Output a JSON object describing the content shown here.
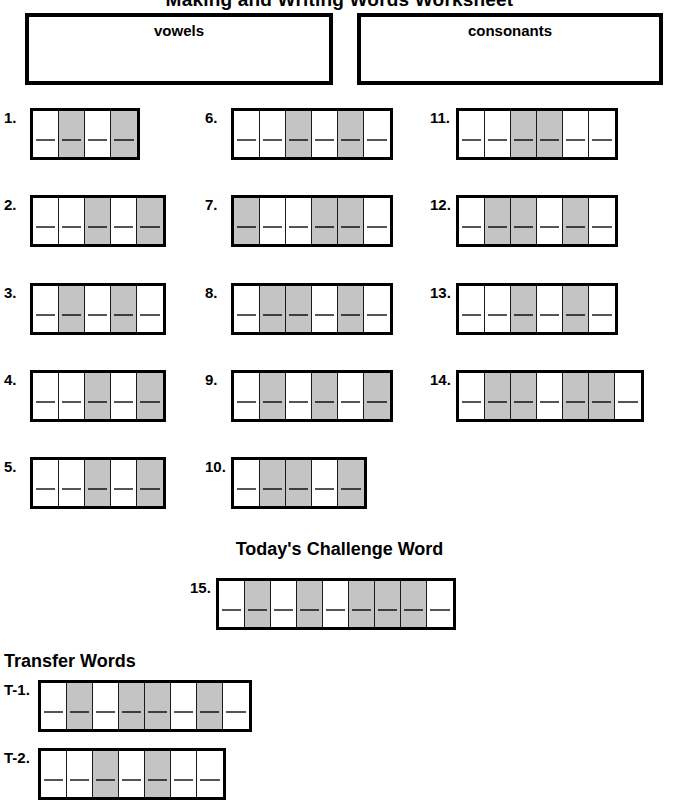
{
  "title": "Making and Writing Words Worksheet",
  "sort_boxes": [
    {
      "id": "vowels",
      "label": "vowels"
    },
    {
      "id": "consonants",
      "label": "consonants"
    }
  ],
  "headings": {
    "challenge": "Today's Challenge Word",
    "transfer": "Transfer Words"
  },
  "legend": {
    "shaded_color": "#c4c4c4",
    "unshaded_color": "#ffffff",
    "border_color": "#000000"
  },
  "word_rows": [
    {
      "number": "1.",
      "cells": 4,
      "shaded": [
        false,
        true,
        false,
        true
      ],
      "left": 4,
      "top": 108
    },
    {
      "number": "2.",
      "cells": 5,
      "shaded": [
        false,
        false,
        true,
        false,
        true
      ],
      "left": 4,
      "top": 195
    },
    {
      "number": "3.",
      "cells": 5,
      "shaded": [
        false,
        true,
        false,
        true,
        false
      ],
      "left": 4,
      "top": 283
    },
    {
      "number": "4.",
      "cells": 5,
      "shaded": [
        false,
        false,
        true,
        false,
        true
      ],
      "left": 4,
      "top": 370
    },
    {
      "number": "5.",
      "cells": 5,
      "shaded": [
        false,
        false,
        true,
        false,
        true
      ],
      "left": 4,
      "top": 457
    },
    {
      "number": "6.",
      "cells": 6,
      "shaded": [
        false,
        false,
        true,
        false,
        true,
        false
      ],
      "left": 205,
      "top": 108
    },
    {
      "number": "7.",
      "cells": 6,
      "shaded": [
        true,
        false,
        false,
        true,
        true,
        false
      ],
      "left": 205,
      "top": 195
    },
    {
      "number": "8.",
      "cells": 6,
      "shaded": [
        false,
        true,
        true,
        false,
        true,
        false
      ],
      "left": 205,
      "top": 283
    },
    {
      "number": "9.",
      "cells": 6,
      "shaded": [
        false,
        true,
        false,
        true,
        false,
        true
      ],
      "left": 205,
      "top": 370
    },
    {
      "number": "10.",
      "cells": 5,
      "shaded": [
        false,
        true,
        true,
        false,
        true
      ],
      "left": 205,
      "top": 457
    },
    {
      "number": "11.",
      "cells": 6,
      "shaded": [
        false,
        false,
        true,
        true,
        false,
        false
      ],
      "left": 430,
      "top": 108
    },
    {
      "number": "12.",
      "cells": 6,
      "shaded": [
        false,
        true,
        true,
        false,
        true,
        false
      ],
      "left": 430,
      "top": 195
    },
    {
      "number": "13.",
      "cells": 6,
      "shaded": [
        false,
        false,
        true,
        false,
        true,
        false
      ],
      "left": 430,
      "top": 283
    },
    {
      "number": "14.",
      "cells": 7,
      "shaded": [
        false,
        true,
        true,
        false,
        true,
        true,
        false
      ],
      "left": 430,
      "top": 370
    }
  ],
  "challenge_row": {
    "number": "15.",
    "cells": 9,
    "shaded": [
      false,
      true,
      false,
      true,
      false,
      true,
      true,
      true,
      false
    ],
    "left": 190,
    "top": 578
  },
  "transfer_rows": [
    {
      "number": "T-1.",
      "cells": 8,
      "shaded": [
        false,
        true,
        false,
        true,
        true,
        false,
        true,
        false
      ],
      "left": 4,
      "top": 680
    },
    {
      "number": "T-2.",
      "cells": 7,
      "shaded": [
        false,
        false,
        true,
        false,
        true,
        false,
        false
      ],
      "left": 4,
      "top": 748
    }
  ]
}
